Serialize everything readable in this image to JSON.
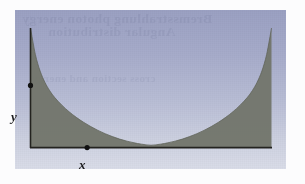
{
  "figure": {
    "caption_ghost_1": "Bremsstrahlung photon energy",
    "caption_ghost_2": "Angular distribution",
    "caption_ghost_3": "cross section and energy",
    "background_top_color": "#9ba1c3",
    "background_bottom_color": "#dadde9",
    "fill_color": "#73766c",
    "axis_color": "#23231f",
    "page_color": "#fcfcfd"
  },
  "axes": {
    "x_label": "x",
    "y_label": "y",
    "x_axis_name": "x-axis",
    "y_axis_name": "y-axis"
  },
  "markers": [
    {
      "name": "y-axis-point-marker",
      "label": "",
      "x": 0.0,
      "y": 0.52
    },
    {
      "name": "x-axis-point-marker",
      "label": "",
      "x": 0.235,
      "y": 0.0
    }
  ],
  "chart_data": {
    "type": "area",
    "title": "",
    "subtitle": "",
    "xlabel": "x",
    "ylabel": "y",
    "xlim": [
      0,
      1
    ],
    "ylim": [
      0,
      1
    ],
    "grid": false,
    "legend": null,
    "shading": "region under curve filled",
    "curve_description": "symmetric U-shaped (catenary-like) curve, steep spikes at both ends, minimum touching the x-axis at center",
    "series": [
      {
        "name": "y(x)",
        "x": [
          0.0,
          0.02,
          0.04,
          0.06,
          0.08,
          0.1,
          0.13,
          0.16,
          0.19,
          0.22,
          0.25,
          0.28,
          0.31,
          0.34,
          0.37,
          0.4,
          0.43,
          0.46,
          0.5,
          0.54,
          0.57,
          0.6,
          0.63,
          0.66,
          0.69,
          0.72,
          0.75,
          0.78,
          0.81,
          0.84,
          0.87,
          0.9,
          0.92,
          0.94,
          0.96,
          0.98,
          1.0
        ],
        "values": [
          1.0,
          0.78,
          0.64,
          0.545,
          0.475,
          0.42,
          0.355,
          0.3,
          0.253,
          0.212,
          0.176,
          0.144,
          0.116,
          0.092,
          0.071,
          0.054,
          0.04,
          0.029,
          0.02,
          0.029,
          0.04,
          0.054,
          0.071,
          0.092,
          0.116,
          0.144,
          0.176,
          0.212,
          0.253,
          0.3,
          0.355,
          0.42,
          0.475,
          0.545,
          0.64,
          0.78,
          1.0
        ]
      }
    ]
  }
}
